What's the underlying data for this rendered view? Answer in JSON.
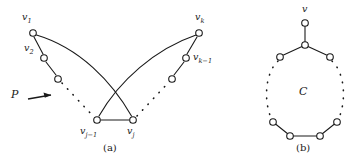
{
  "figure": {
    "panels": [
      {
        "id": "a",
        "caption": "(a)",
        "path_label": "P",
        "vertex_labels": {
          "v1": "v",
          "v1_sub": "1",
          "v2": "v",
          "v2_sub": "2",
          "vk": "v",
          "vk_sub": "k",
          "vk1": "v",
          "vk1_sub": "k−1",
          "vj1": "v",
          "vj1_sub": "j−1",
          "vj": "v",
          "vj_sub": "j"
        }
      },
      {
        "id": "b",
        "caption": "(b)",
        "cycle_label": "C",
        "vertex_labels": {
          "v": "v"
        }
      }
    ]
  },
  "colors": {
    "stroke": "#1a1a1a",
    "node_fill": "#ffffff",
    "background": "#ffffff"
  },
  "diagram_data": {
    "type": "graph-diagram",
    "panel_a": {
      "description": "Path P with endpoints v1 and vk, crossing chords to vj-1 and vj forming a triangle",
      "nodes": [
        {
          "name": "v1",
          "x": 33,
          "y": 33
        },
        {
          "name": "v2",
          "x": 44,
          "y": 58
        },
        {
          "name": "p3",
          "x": 58,
          "y": 79
        },
        {
          "name": "vj-1",
          "x": 97,
          "y": 120
        },
        {
          "name": "vj",
          "x": 133,
          "y": 120
        },
        {
          "name": "pk3",
          "x": 172,
          "y": 79
        },
        {
          "name": "vk-1",
          "x": 186,
          "y": 58
        },
        {
          "name": "vk",
          "x": 199,
          "y": 33
        }
      ],
      "solid_edges": [
        [
          "v1",
          "v2"
        ],
        [
          "v2",
          "p3"
        ],
        [
          "vj-1",
          "vj"
        ],
        [
          "pk3",
          "vk-1"
        ],
        [
          "vk-1",
          "vk"
        ]
      ],
      "dotted_edges": [
        [
          "p3",
          "vj-1"
        ],
        [
          "vj",
          "pk3"
        ]
      ],
      "curved_chords": [
        [
          "v1",
          "vj"
        ],
        [
          "vk",
          "vj-1"
        ]
      ],
      "crossing": true
    },
    "panel_b": {
      "description": "Cycle C with pendant vertex v attached to the top cycle vertex",
      "pendant": {
        "name": "v",
        "x": 305,
        "y": 23
      },
      "cycle_center": {
        "x": 305,
        "y": 93
      },
      "cycle_radius": 48,
      "cycle_nodes": 10,
      "solid_arc_positions": [
        "top",
        "bottom"
      ],
      "dotted_arc_positions": [
        "left",
        "right"
      ]
    }
  }
}
